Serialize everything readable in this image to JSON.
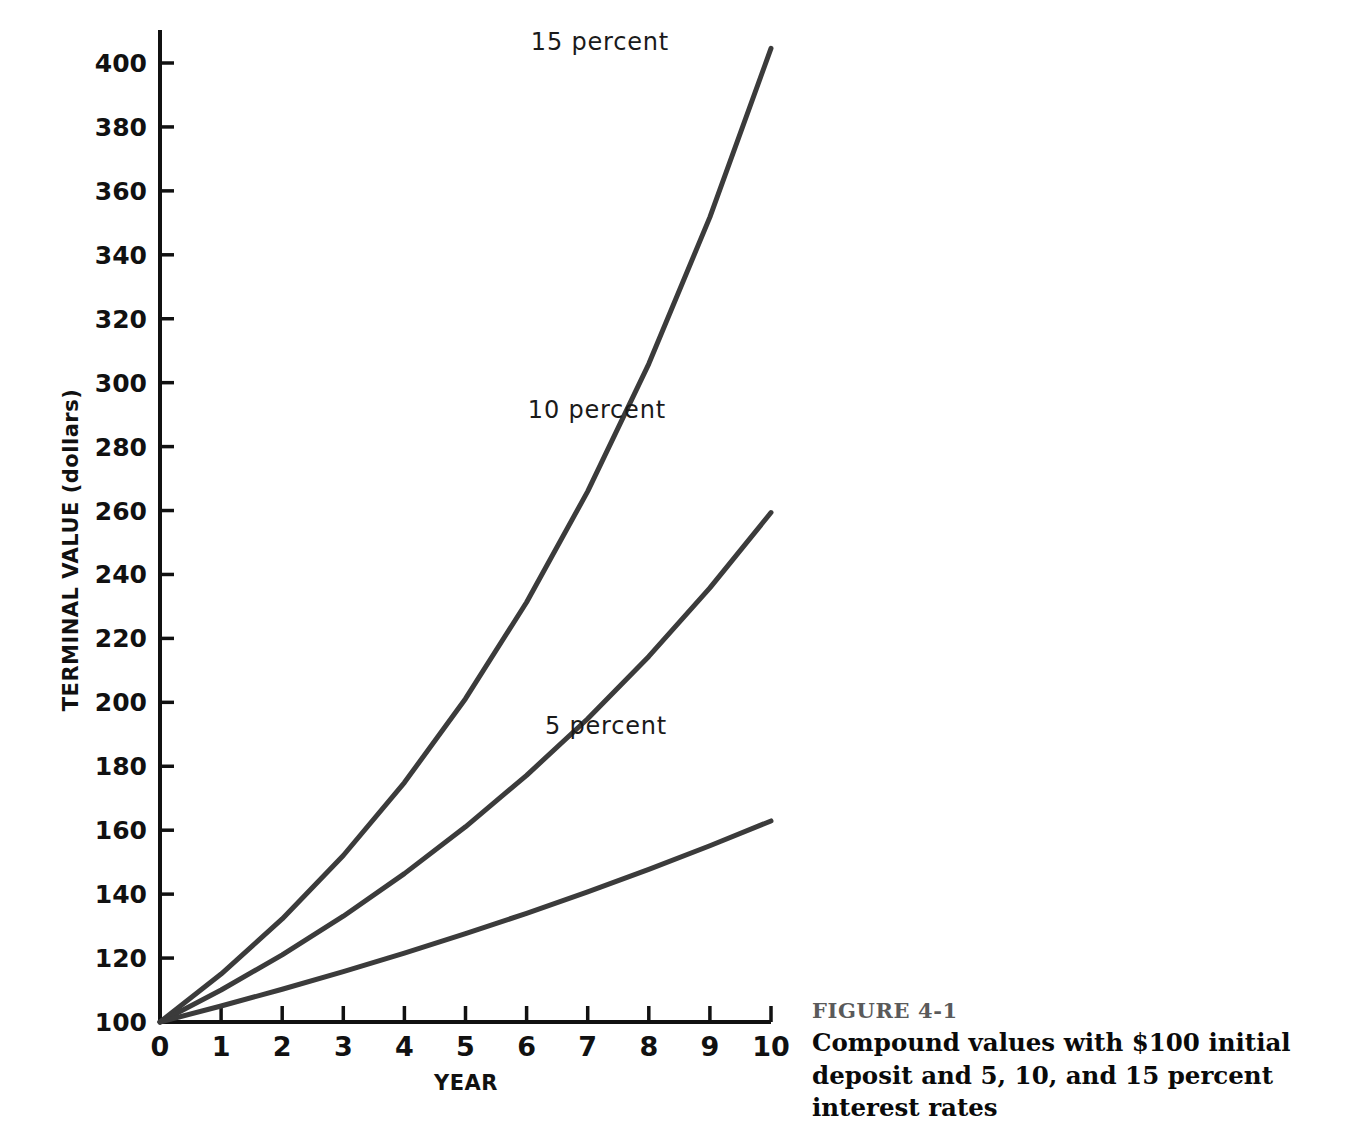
{
  "figure": {
    "number_label": "FIGURE 4-1",
    "caption": "Compound values with $100 initial deposit and 5, 10, and 15 percent interest rates",
    "background_color": "#ffffff",
    "number_color": "#5a5a5a",
    "caption_color": "#0a0a0a"
  },
  "chart_data": {
    "type": "line",
    "title": "",
    "subtitle": "",
    "xlabel": "YEAR",
    "ylabel": "TERMINAL VALUE (dollars)",
    "x": [
      0,
      1,
      2,
      3,
      4,
      5,
      6,
      7,
      8,
      9,
      10
    ],
    "xlim": [
      0,
      10
    ],
    "ylim": [
      100,
      410
    ],
    "xticks": [
      0,
      1,
      2,
      3,
      4,
      5,
      6,
      7,
      8,
      9,
      10
    ],
    "xtick_labels": [
      "0",
      "1",
      "2",
      "3",
      "4",
      "5",
      "6",
      "7",
      "8",
      "9",
      "10"
    ],
    "yticks": [
      100,
      120,
      140,
      160,
      180,
      200,
      220,
      240,
      260,
      280,
      300,
      320,
      340,
      360,
      380,
      400
    ],
    "ytick_labels": [
      "100",
      "120",
      "140",
      "160",
      "180",
      "200",
      "220",
      "240",
      "260",
      "280",
      "300",
      "320",
      "340",
      "360",
      "380",
      "400"
    ],
    "grid": false,
    "legend": "inline-annotations",
    "line_color": "#3b3b3b",
    "line_width": 5,
    "series": [
      {
        "name": "15 percent",
        "rate": 0.15,
        "label": "15 percent",
        "label_x": 7.2,
        "label_y": 404,
        "values": [
          100,
          115,
          132.25,
          152.09,
          174.9,
          201.14,
          231.31,
          266.0,
          305.9,
          351.79,
          404.56
        ]
      },
      {
        "name": "10 percent",
        "rate": 0.1,
        "label": "10 percent",
        "label_x": 7.15,
        "label_y": 289,
        "values": [
          100,
          110,
          121,
          133.1,
          146.41,
          161.05,
          177.16,
          194.87,
          214.36,
          235.79,
          259.37
        ]
      },
      {
        "name": "5 percent",
        "rate": 0.05,
        "label": "5 percent",
        "label_x": 7.3,
        "label_y": 190,
        "values": [
          100,
          105,
          110.25,
          115.76,
          121.55,
          127.63,
          134.01,
          140.71,
          147.75,
          155.13,
          162.89
        ]
      }
    ]
  }
}
